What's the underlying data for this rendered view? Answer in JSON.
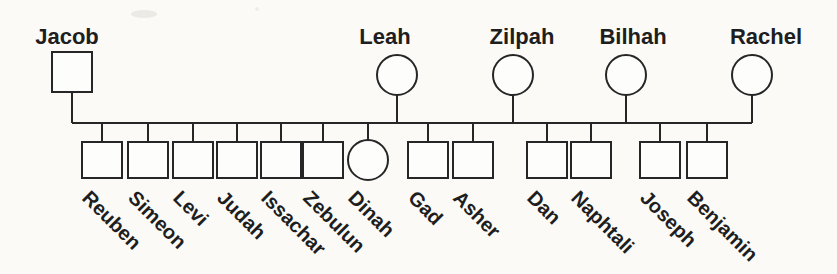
{
  "diagram": {
    "type": "genogram-family-tree",
    "father": {
      "name": "Jacob",
      "sex": "male"
    },
    "mothers": [
      {
        "name": "Leah",
        "sex": "female"
      },
      {
        "name": "Zilpah",
        "sex": "female"
      },
      {
        "name": "Bilhah",
        "sex": "female"
      },
      {
        "name": "Rachel",
        "sex": "female"
      }
    ],
    "children": [
      {
        "name": "Reuben",
        "sex": "male"
      },
      {
        "name": "Simeon",
        "sex": "male"
      },
      {
        "name": "Levi",
        "sex": "male"
      },
      {
        "name": "Judah",
        "sex": "male"
      },
      {
        "name": "Issachar",
        "sex": "male"
      },
      {
        "name": "Zebulun",
        "sex": "male"
      },
      {
        "name": "Dinah",
        "sex": "female"
      },
      {
        "name": "Gad",
        "sex": "male"
      },
      {
        "name": "Asher",
        "sex": "male"
      },
      {
        "name": "Dan",
        "sex": "male"
      },
      {
        "name": "Naphtali",
        "sex": "male"
      },
      {
        "name": "Joseph",
        "sex": "male"
      },
      {
        "name": "Benjamin",
        "sex": "male"
      }
    ],
    "legend": {
      "male_symbol": "square",
      "female_symbol": "circle"
    },
    "colors": {
      "background": "#fbfaf7",
      "line": "#262626",
      "text": "#1e1e1e",
      "shape_fill": "#fdfdfb"
    }
  }
}
